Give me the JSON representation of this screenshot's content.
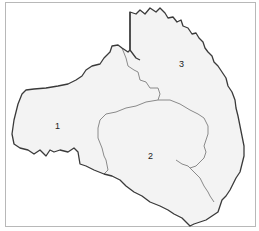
{
  "map": {
    "regions": [
      {
        "id": "1",
        "label": "1"
      },
      {
        "id": "2",
        "label": "2"
      },
      {
        "id": "3",
        "label": "3"
      }
    ],
    "colors": {
      "region_fill": "#f3f3f3",
      "outer_boundary": "#3a3a3a",
      "inner_boundary": "#8a8a8a",
      "frame": "#b8b8b8"
    }
  }
}
